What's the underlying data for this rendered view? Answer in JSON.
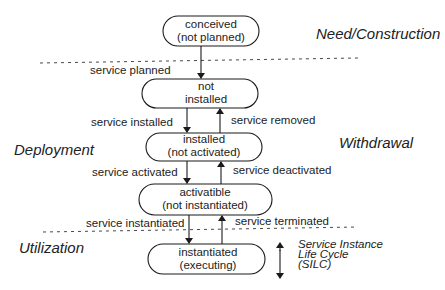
{
  "diagram": {
    "phases": {
      "need_construction": "Need/Construction",
      "deployment": "Deployment",
      "withdrawal": "Withdrawal",
      "utilization": "Utilization"
    },
    "states": [
      {
        "line1": "conceived",
        "line2": "(not planned)"
      },
      {
        "line1": "not",
        "line2": "installed"
      },
      {
        "line1": "installed",
        "line2": "(not activated)"
      },
      {
        "line1": "activatible",
        "line2": "(not instantiated)"
      },
      {
        "line1": "instantiated",
        "line2": "(executing)"
      }
    ],
    "transitions": {
      "planned": "service planned",
      "installed": "service installed",
      "removed": "service removed",
      "activated": "service activated",
      "deactivated": "service deactivated",
      "instantiated": "service instantiated",
      "terminated": "service terminated"
    },
    "legend": {
      "line1": "Service Instance",
      "line2": "Life Cycle",
      "line3": "(SILC)"
    },
    "colors": {
      "stroke": "#1a1a1a",
      "text": "#222222",
      "background": "#ffffff"
    }
  }
}
